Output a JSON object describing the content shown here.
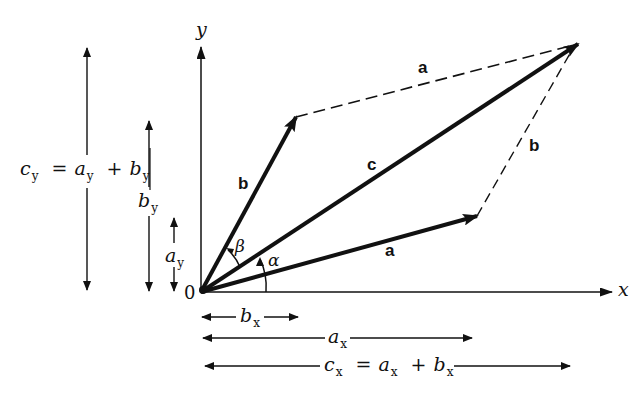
{
  "diagram": {
    "type": "vector-addition-parallelogram",
    "axes": {
      "x_label": "x",
      "y_label": "y",
      "origin_label": "0"
    },
    "vectors": {
      "a": {
        "label": "a",
        "style": "solid-bold"
      },
      "b": {
        "label": "b",
        "style": "solid-bold"
      },
      "c": {
        "label": "c",
        "style": "solid-bold"
      },
      "a_dashed": {
        "label": "a",
        "style": "dashed"
      },
      "b_dashed": {
        "label": "b",
        "style": "dashed"
      }
    },
    "angles": {
      "alpha": "α",
      "beta": "β"
    },
    "components": {
      "cy": {
        "main": "c",
        "sub": "y",
        "eq": "=",
        "t1": "a",
        "t1sub": "y",
        "plus": "+",
        "t2": "b",
        "t2sub": "y"
      },
      "by": {
        "main": "b",
        "sub": "y"
      },
      "ay": {
        "main": "a",
        "sub": "y"
      },
      "bx": {
        "main": "b",
        "sub": "x"
      },
      "ax": {
        "main": "a",
        "sub": "x"
      },
      "cx": {
        "main": "c",
        "sub": "x",
        "eq": "=",
        "t1": "a",
        "t1sub": "x",
        "plus": "+",
        "t2": "b",
        "t2sub": "x"
      }
    },
    "colors": {
      "ink": "#111111",
      "background": "#ffffff"
    }
  }
}
